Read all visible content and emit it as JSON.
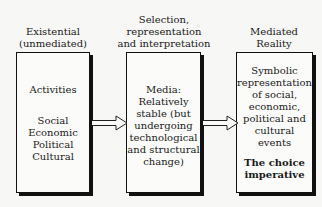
{
  "columns": [
    {
      "header": [
        "Existential",
        "(unmediated)"
      ],
      "box": {
        "title": "Activities",
        "lines": [
          "Social",
          "Economic",
          "Political",
          "Cultural"
        ]
      }
    },
    {
      "header": [
        "Selection,",
        "representation",
        "and interpretation"
      ],
      "box": {
        "lines": [
          "Media:",
          "Relatively",
          "stable (but",
          "undergoing",
          "technological",
          "and structural",
          "change)"
        ]
      }
    },
    {
      "header": [
        "Mediated",
        "Reality"
      ],
      "box": {
        "lines": [
          "Symbolic",
          "representation",
          "of social,",
          "economic,",
          "political and",
          "cultural",
          "events"
        ],
        "emphasis": [
          "The choice",
          "imperative"
        ]
      }
    }
  ],
  "arrows": [
    {
      "from": "existential",
      "to": "media"
    },
    {
      "from": "media",
      "to": "mediated-reality"
    }
  ]
}
